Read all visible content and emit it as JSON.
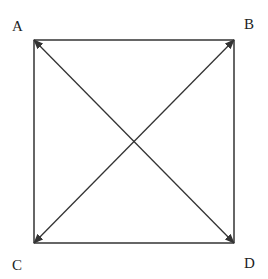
{
  "diagram": {
    "type": "square-with-diagonals",
    "colors": {
      "stroke": "#333333",
      "label": "#222222",
      "background": "#ffffff"
    },
    "vertices": [
      {
        "id": "A",
        "label": "A",
        "x": 34,
        "y": 40,
        "label_x": 12,
        "label_y": 31
      },
      {
        "id": "B",
        "label": "B",
        "x": 234,
        "y": 40,
        "label_x": 244,
        "label_y": 29
      },
      {
        "id": "C",
        "label": "C",
        "x": 34,
        "y": 243,
        "label_x": 12,
        "label_y": 270
      },
      {
        "id": "D",
        "label": "D",
        "x": 234,
        "y": 243,
        "label_x": 244,
        "label_y": 268
      }
    ],
    "edges": [
      {
        "from": "A",
        "to": "B",
        "arrow": "none"
      },
      {
        "from": "B",
        "to": "D",
        "arrow": "none"
      },
      {
        "from": "D",
        "to": "C",
        "arrow": "none"
      },
      {
        "from": "C",
        "to": "A",
        "arrow": "none"
      },
      {
        "from": "A",
        "to": "D",
        "arrow": "both"
      },
      {
        "from": "B",
        "to": "C",
        "arrow": "both"
      }
    ]
  }
}
